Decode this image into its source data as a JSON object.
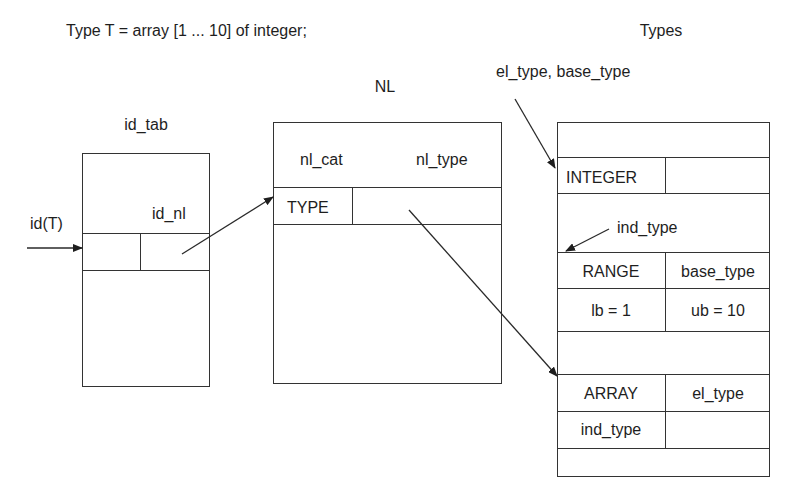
{
  "declaration": "Type T = array [1 ... 10] of integer;",
  "id_tab": {
    "title": "id_tab",
    "field_label": "id_nl",
    "input_label": "id(T)"
  },
  "nl": {
    "title": "NL",
    "col1_header": "nl_cat",
    "col2_header": "nl_type",
    "row_cat": "TYPE"
  },
  "types": {
    "title": "Types",
    "pointer_label": "el_type, base_type",
    "integer_cell": "INTEGER",
    "ind_type_pointer_label": "ind_type",
    "range_cell": "RANGE",
    "base_type_cell": "base_type",
    "lb_cell": "lb = 1",
    "ub_cell": "ub = 10",
    "array_cell": "ARRAY",
    "el_type_cell": "el_type",
    "ind_type_cell": "ind_type"
  },
  "colors": {
    "line": "#333333",
    "text": "#1e1e1e",
    "background": "#ffffff"
  }
}
